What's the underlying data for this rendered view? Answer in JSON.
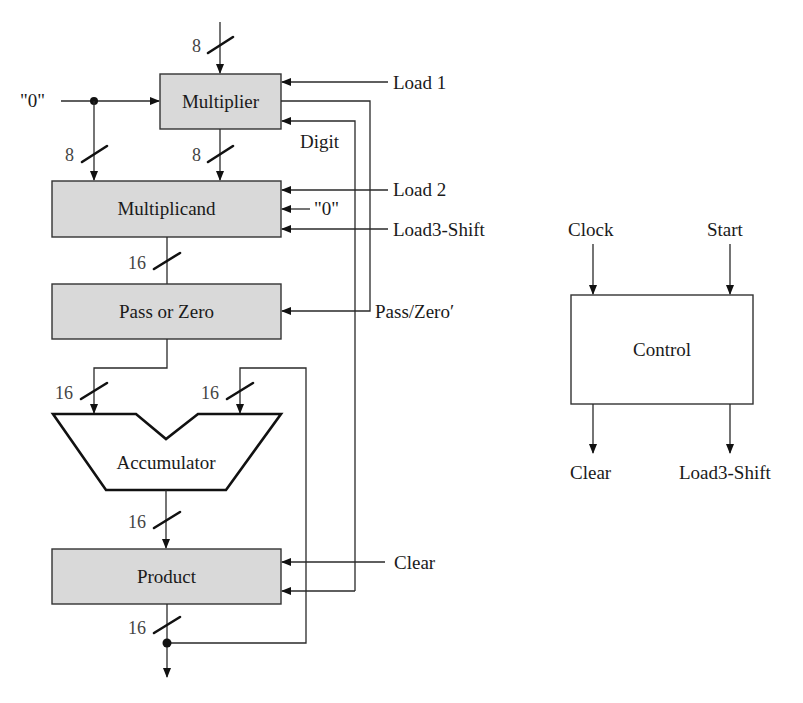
{
  "blocks": {
    "multiplier": "Multiplier",
    "multiplicand": "Multiplicand",
    "pass_or_zero": "Pass or Zero",
    "accumulator": "Accumulator",
    "product": "Product",
    "control": "Control"
  },
  "signals": {
    "load1": "Load 1",
    "load2": "Load 2",
    "load3_shift": "Load3-Shift",
    "zero_left": "\"0\"",
    "zero_right": "\"0\"",
    "digit": "Digit",
    "pass_zero": "Pass/Zero′",
    "clear": "Clear"
  },
  "control": {
    "inputs": {
      "clock": "Clock",
      "start": "Start"
    },
    "outputs": {
      "clear": "Clear",
      "load3_shift": "Load3-Shift"
    }
  },
  "bus_widths": {
    "multiplier_in": "8",
    "zero_to_multiplicand": "8",
    "multiplier_to_multiplicand": "8",
    "multiplicand_to_pass": "16",
    "pass_to_acc": "16",
    "feedback_to_acc": "16",
    "acc_to_product": "16",
    "product_out": "16"
  }
}
